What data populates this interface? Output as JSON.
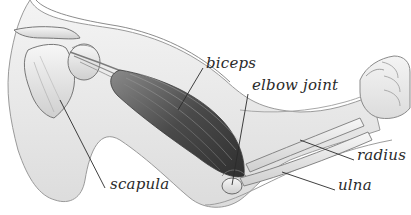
{
  "diagram": {
    "background": "#ffffff",
    "ink_color": "#2a2a2a",
    "labels": [
      {
        "id": "biceps",
        "text": "biceps",
        "x": 206,
        "y": 56,
        "line": [
          [
            203,
            68
          ],
          [
            178,
            110
          ]
        ]
      },
      {
        "id": "elbow-joint",
        "text": "elbow joint",
        "x": 252,
        "y": 78,
        "line": [
          [
            248,
            94
          ],
          [
            232,
            185
          ]
        ]
      },
      {
        "id": "radius",
        "text": "radius",
        "x": 357,
        "y": 148,
        "line": [
          [
            354,
            160
          ],
          [
            300,
            140
          ]
        ]
      },
      {
        "id": "ulna",
        "text": "ulna",
        "x": 338,
        "y": 178,
        "line": [
          [
            335,
            190
          ],
          [
            282,
            172
          ]
        ]
      },
      {
        "id": "scapula",
        "text": "scapula",
        "x": 110,
        "y": 177,
        "line": [
          [
            105,
            188
          ],
          [
            60,
            100
          ]
        ]
      }
    ]
  }
}
